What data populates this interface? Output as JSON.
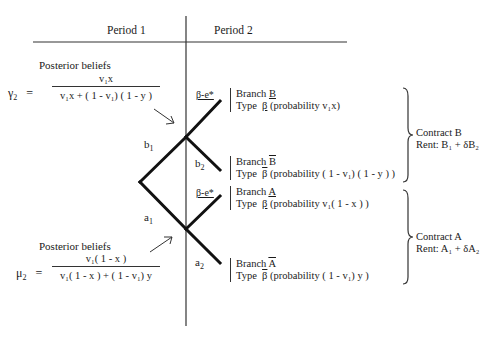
{
  "headers": {
    "period1": "Period 1",
    "period2": "Period 2"
  },
  "posterior_top": {
    "title": "Posterior beliefs",
    "lhs": "γ",
    "lhs_sub": "2",
    "equals": "=",
    "numerator": "v₁x",
    "denominator": "v₁x + ( 1 - v₁) ( 1 - y )"
  },
  "posterior_bottom": {
    "title": "Posterior beliefs",
    "lhs": "μ",
    "lhs_sub": "2",
    "equals": "=",
    "numerator": "v₁( 1 - x )",
    "denominator": "v₁( 1 - x ) + ( 1 - v₁) y"
  },
  "edge_labels": {
    "b1": "b",
    "b1_sub": "1",
    "a1": "a",
    "a1_sub": "1",
    "b2": "b",
    "b2_sub": "2",
    "a2": "a",
    "a2_sub": "2",
    "effort_upper": "β-e*",
    "effort_lower": "β-e*"
  },
  "branches": [
    {
      "branch_prefix": "Branch",
      "branch_name": "B",
      "mark": "underline",
      "type_prefix": "Type",
      "type_symbol": "β",
      "probability": "(probability  v₁x)"
    },
    {
      "branch_prefix": "Branch",
      "branch_name": "B",
      "mark": "overline",
      "type_prefix": "Type",
      "type_symbol": "β",
      "probability": "(probability  ( 1 - v₁) ( 1 - y ) )"
    },
    {
      "branch_prefix": "Branch",
      "branch_name": "A",
      "mark": "underline",
      "type_prefix": "Type",
      "type_symbol": "β",
      "probability": "(probability  v₁( 1 - x ) )"
    },
    {
      "branch_prefix": "Branch",
      "branch_name": "A",
      "mark": "overline",
      "type_prefix": "Type",
      "type_symbol": "β",
      "probability": "(probability  ( 1 - v₁) y )"
    }
  ],
  "contracts": [
    {
      "name": "Contract  B",
      "rent": "Rent:  B₁ + δB₂"
    },
    {
      "name": "Contract  A",
      "rent": "Rent:  A₁ + δA₂"
    }
  ]
}
